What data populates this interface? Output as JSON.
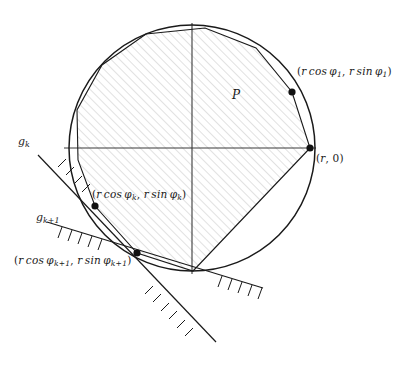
{
  "figure": {
    "kind": "geometry-diagram",
    "background_color": "#ffffff",
    "stroke_color": "#1a1a1a",
    "hatch_color": "#b9b9b9",
    "axis_color": "#3a3a3a"
  },
  "labels": {
    "region": "P",
    "vertex_phi1": "(r cos φ₁, r sin φ₁)",
    "vertex_r0": "(r, 0)",
    "vertex_phik": "(r cos φₖ, r sin φₖ)",
    "vertex_phik1": "(r cos φₖ₊₁, r sin φₖ₊₁)",
    "line_gk": "gₖ",
    "line_gk1": "gₖ₊₁"
  },
  "label_parts": {
    "vertex_phi1": {
      "open": "(",
      "x_fn": "r",
      "cos": "cos",
      "x_ang": "φ",
      "x_sub": "1",
      "sep": ", ",
      "y_fn": "r",
      "sin": "sin",
      "y_ang": "φ",
      "y_sub": "1",
      "close": ")"
    },
    "vertex_phik": {
      "open": "(",
      "x_fn": "r",
      "cos": "cos",
      "x_ang": "φ",
      "x_sub": "k",
      "sep": ", ",
      "y_fn": "r",
      "sin": "sin",
      "y_ang": "φ",
      "y_sub": "k",
      "close": ")"
    },
    "vertex_phik1": {
      "open": "(",
      "x_fn": "r",
      "cos": "cos",
      "x_ang": "φ",
      "x_sub": "k+1",
      "sep": ", ",
      "y_fn": "r",
      "sin": "sin",
      "y_ang": "φ",
      "y_sub": "k+1",
      "close": ")"
    },
    "vertex_r0": {
      "open": "(",
      "radius": "r",
      "sep": ", ",
      "zero": "0",
      "close": ")"
    },
    "line_gk": {
      "base": "g",
      "sub": "k"
    },
    "line_gk1": {
      "base": "g",
      "sub": "k+1"
    }
  },
  "geometry": {
    "center": {
      "x": 192,
      "y": 148
    },
    "radius": 123,
    "axis_x": {
      "x1": 64,
      "y1": 148,
      "x2": 316,
      "y2": 148
    },
    "axis_y": {
      "x1": 192,
      "y1": 23,
      "x2": 192,
      "y2": 274
    },
    "vertices": [
      {
        "name": "r0",
        "x": 310,
        "y": 148
      },
      {
        "name": "phi1",
        "x": 292,
        "y": 92
      },
      {
        "name": "phik",
        "x": 95,
        "y": 206
      },
      {
        "name": "phik1",
        "x": 137,
        "y": 253
      }
    ],
    "polygon_points": "310,148 292,92 256,48 205,28 146,34 102,65 77,110 78,160 95,206 137,253 193,271",
    "line_gk": {
      "x1": 38,
      "y1": 155,
      "x2": 216,
      "y2": 342
    },
    "line_gk1": {
      "x1": 47,
      "y1": 222,
      "x2": 263,
      "y2": 288
    }
  }
}
